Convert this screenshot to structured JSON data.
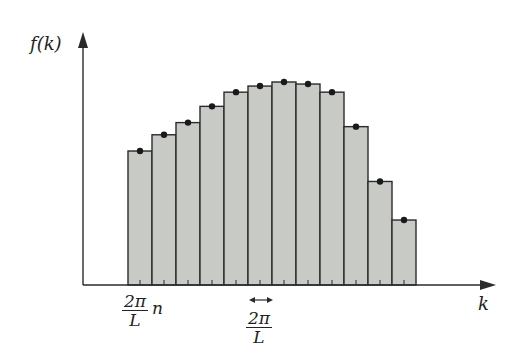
{
  "labels": {
    "y_axis": "f(k)",
    "x_axis": "k",
    "start_label_num": "2π",
    "start_label_den": "L",
    "start_label_suffix": "n",
    "spacing_label_num": "2π",
    "spacing_label_den": "L"
  },
  "colors": {
    "bar_fill": "#c8cac6",
    "stroke": "#2a2a2a",
    "dot": "#1a1a1a"
  },
  "chart_data": {
    "type": "bar",
    "title": "",
    "xlabel": "k",
    "ylabel": "f(k)",
    "categories": [
      "n",
      "n+1",
      "n+2",
      "n+3",
      "n+4",
      "n+5",
      "n+6",
      "n+7",
      "n+8",
      "n+9",
      "n+10",
      "n+11"
    ],
    "values": [
      0.66,
      0.74,
      0.8,
      0.88,
      0.95,
      0.98,
      1.0,
      0.99,
      0.95,
      0.78,
      0.51,
      0.32
    ],
    "bar_width": "2π/L",
    "markers": "dot at center-top of each bar",
    "grid": false,
    "legend": "none"
  }
}
